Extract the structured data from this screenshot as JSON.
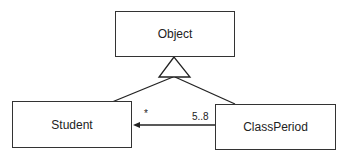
{
  "diagram": {
    "type": "UML class diagram",
    "classes": {
      "object": "Object",
      "student": "Student",
      "class_period": "ClassPeriod"
    },
    "relations": {
      "generalization": "Student and ClassPeriod inherit from Object",
      "association": {
        "from": "ClassPeriod",
        "to": "Student",
        "student_multiplicity": "*",
        "class_period_multiplicity": "5..8"
      }
    }
  }
}
